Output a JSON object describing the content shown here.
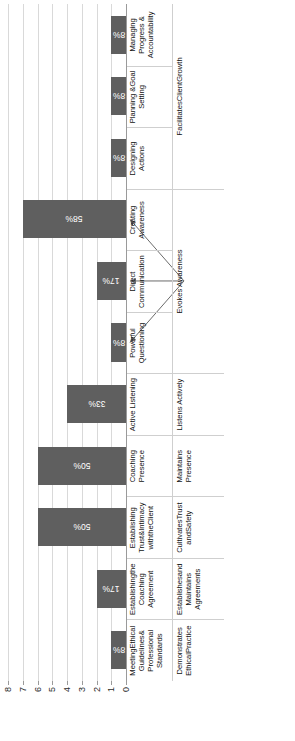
{
  "chart_data": {
    "type": "bar",
    "title": "",
    "xlabel": "",
    "ylabel": "Number of participants",
    "ylim": [
      0,
      8
    ],
    "yticks": [
      0,
      1,
      2,
      3,
      4,
      5,
      6,
      7,
      8
    ],
    "grid": true,
    "legend": "none",
    "bar_color": "#5f5f5f",
    "categories": [
      "MeetingEthical\nGuidelines&\nProfessional\nStandards",
      "Establishingthe\nCoaching\nAgreement",
      "Establishing\nTrust&Intimacy\nwiththeClient",
      "Coaching\nPresence",
      "Active Listening",
      "Powerful\nQuestioning",
      "Direct\nCommunication",
      "Creating\nAwareness",
      "Designing\nActions",
      "Planning &Goal\nSetting",
      "Managing\nProgress &\nAccountability"
    ],
    "values": [
      1,
      2,
      6,
      6,
      4,
      1,
      2,
      7,
      1,
      1,
      1
    ],
    "data_labels": [
      "8%",
      "17%",
      "50%",
      "50%",
      "33%",
      "8%",
      "17%",
      "58%",
      "8%",
      "8%",
      "8%"
    ],
    "groups": [
      {
        "name": "Demonstrates\nEthicalPractice",
        "span": 1
      },
      {
        "name": "Establishesand\nMaintains\nAgreements",
        "span": 1
      },
      {
        "name": "CultivatesTrust\nandSafety",
        "span": 1
      },
      {
        "name": "Maintains\nPresence",
        "span": 1
      },
      {
        "name": "Listens Actively",
        "span": 1
      },
      {
        "name": "Evokes Awareness",
        "span": 3
      },
      {
        "name": "FacilitatesClientGrowth",
        "span": 3
      }
    ],
    "annotations": [
      {
        "label": "Evokes Awareness",
        "points_from": [
          "Powerful Questioning",
          "Direct Communication",
          "Creating Awareness"
        ]
      }
    ]
  }
}
